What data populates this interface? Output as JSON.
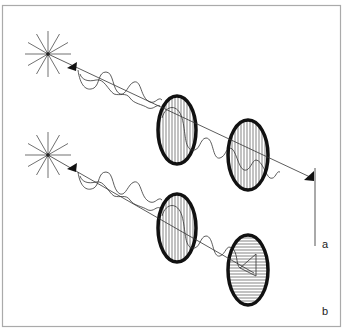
{
  "diagram": {
    "panels": [
      {
        "id": "a",
        "label": "a",
        "source": "unpolarized-light-source",
        "filters": [
          {
            "orientation": "vertical",
            "hatching": "vertical"
          },
          {
            "orientation": "vertical",
            "hatching": "vertical"
          }
        ],
        "result": "light transmitted (vertical polarization)",
        "indicator": "vertical-line"
      },
      {
        "id": "b",
        "label": "b",
        "source": "unpolarized-light-source",
        "filters": [
          {
            "orientation": "vertical",
            "hatching": "vertical"
          },
          {
            "orientation": "horizontal",
            "hatching": "horizontal"
          }
        ],
        "result": "light blocked"
      }
    ]
  },
  "colors": {
    "line": "#222222",
    "frame": "#aaaaaa",
    "background": "#ffffff"
  }
}
